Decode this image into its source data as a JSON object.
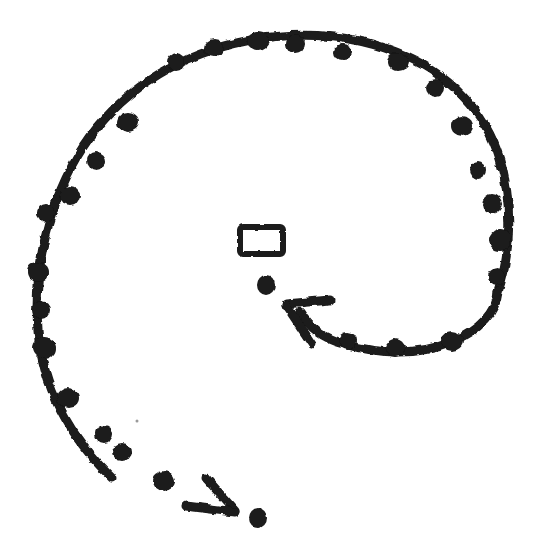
{
  "image": {
    "kind": "hand-drawn-ink-sketch",
    "title": "Hand-drawn spiral with arrows",
    "width": 538,
    "height": 559,
    "background_color": "#ffffff",
    "ink_color": "#1a1a1a"
  },
  "elements": {
    "spiral": {
      "name": "Spiral stroke",
      "description": "Rough hand-drawn spiral sweeping counter-clockwise from the inner right, outward around the page and ending at the lower-left tail",
      "stroke_color": "#1a1a1a",
      "stroke_width": 9,
      "texture": "beaded, knotted, irregular ink line",
      "outer_path": "M 498 292 C 512 250 512 200 500 160 C 486 112 448 72 396 52 C 340 30 272 30 212 50 C 150 70 100 112 72 166 C 44 220 34 276 38 330 C 42 386 70 438 112 478",
      "inner_path": "M 498 292 C 496 312 480 330 452 342 C 418 356 378 354 344 344 C 322 338 308 326 300 312"
    },
    "arrow_inner": {
      "name": "Inner arrowhead",
      "description": "Arrowhead at the end of the inner spiral curve, pointing up and to the left toward the centre",
      "tip_x": 285,
      "tip_y": 303,
      "direction": "up-left",
      "stroke_color": "#1a1a1a",
      "stroke_width": 9,
      "barb_upper": "M 286 304 L 330 300",
      "barb_lower": "M 286 305 L 312 344"
    },
    "arrow_tail": {
      "name": "Tail arrowhead",
      "description": "Arrowhead at the end of the lower-left spiral tail, pointing down and to the right",
      "tip_x": 236,
      "tip_y": 512,
      "direction": "down-right",
      "stroke_color": "#1a1a1a",
      "stroke_width": 9,
      "barb_upper": "M 235 511 L 206 478",
      "barb_lower": "M 235 512 L 186 506"
    },
    "rectangle": {
      "name": "Small rectangle outline",
      "description": "Small hand-drawn open rectangle near the centre of the spiral",
      "x": 240,
      "y": 227,
      "width": 43,
      "height": 27,
      "stroke_color": "#1a1a1a",
      "stroke_width": 6,
      "fill": "none"
    },
    "blob_center": {
      "name": "Centre ink blob",
      "description": "Small solid ink blob just below the rectangle",
      "cx": 266,
      "cy": 285,
      "rx": 9,
      "ry": 10,
      "fill_color": "#1a1a1a"
    },
    "blob_tail": {
      "name": "Tail ink blob",
      "description": "Small solid ink blob to the right of the lower arrowhead",
      "cx": 258,
      "cy": 518,
      "rx": 9,
      "ry": 10,
      "fill_color": "#1a1a1a"
    },
    "speck": {
      "name": "Faint ink speck",
      "description": "Tiny faint mark inside the lower-left of the spiral",
      "cx": 137,
      "cy": 421,
      "r": 1.5,
      "fill_color": "#9a9a9a"
    }
  },
  "knots": {
    "name": "Ink knots",
    "description": "Thickened blobs distributed along the spiral stroke where the pen pressed harder",
    "fill_color": "#1a1a1a",
    "points": [
      {
        "cx": 258,
        "cy": 41,
        "rx": 11,
        "ry": 9
      },
      {
        "cx": 295,
        "cy": 44,
        "rx": 10,
        "ry": 9
      },
      {
        "cx": 343,
        "cy": 52,
        "rx": 9,
        "ry": 8
      },
      {
        "cx": 398,
        "cy": 62,
        "rx": 11,
        "ry": 9
      },
      {
        "cx": 436,
        "cy": 88,
        "rx": 9,
        "ry": 9
      },
      {
        "cx": 462,
        "cy": 126,
        "rx": 11,
        "ry": 10
      },
      {
        "cx": 478,
        "cy": 170,
        "rx": 8,
        "ry": 9
      },
      {
        "cx": 492,
        "cy": 204,
        "rx": 10,
        "ry": 10
      },
      {
        "cx": 500,
        "cy": 240,
        "rx": 11,
        "ry": 11
      },
      {
        "cx": 497,
        "cy": 277,
        "rx": 9,
        "ry": 9
      },
      {
        "cx": 452,
        "cy": 341,
        "rx": 11,
        "ry": 10
      },
      {
        "cx": 395,
        "cy": 348,
        "rx": 10,
        "ry": 9
      },
      {
        "cx": 348,
        "cy": 341,
        "rx": 9,
        "ry": 9
      },
      {
        "cx": 214,
        "cy": 48,
        "rx": 10,
        "ry": 9
      },
      {
        "cx": 176,
        "cy": 62,
        "rx": 9,
        "ry": 9
      },
      {
        "cx": 128,
        "cy": 122,
        "rx": 11,
        "ry": 10
      },
      {
        "cx": 96,
        "cy": 161,
        "rx": 9,
        "ry": 9
      },
      {
        "cx": 70,
        "cy": 196,
        "rx": 10,
        "ry": 9
      },
      {
        "cx": 46,
        "cy": 213,
        "rx": 9,
        "ry": 9
      },
      {
        "cx": 38,
        "cy": 272,
        "rx": 11,
        "ry": 10
      },
      {
        "cx": 41,
        "cy": 310,
        "rx": 9,
        "ry": 9
      },
      {
        "cx": 44,
        "cy": 348,
        "rx": 12,
        "ry": 11
      },
      {
        "cx": 68,
        "cy": 398,
        "rx": 11,
        "ry": 10
      },
      {
        "cx": 104,
        "cy": 434,
        "rx": 9,
        "ry": 9
      },
      {
        "cx": 122,
        "cy": 452,
        "rx": 10,
        "ry": 9
      },
      {
        "cx": 164,
        "cy": 481,
        "rx": 11,
        "ry": 10
      }
    ]
  }
}
